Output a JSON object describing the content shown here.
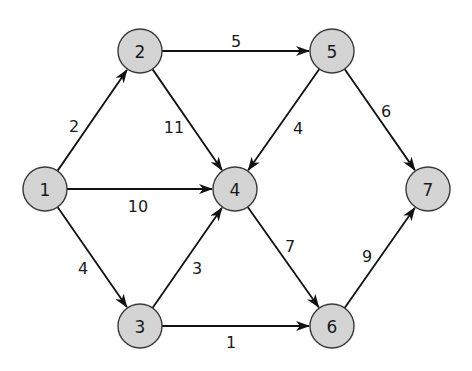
{
  "graph": {
    "type": "directed-weighted",
    "node_radius": 22,
    "colors": {
      "node_fill": "#d4d4d4",
      "node_stroke": "#3a3a3a",
      "edge": "#111111",
      "text": "#1a1a1a"
    },
    "nodes": [
      {
        "id": "1",
        "label": "1",
        "x": 45,
        "y": 189
      },
      {
        "id": "2",
        "label": "2",
        "x": 140,
        "y": 51
      },
      {
        "id": "3",
        "label": "3",
        "x": 140,
        "y": 326
      },
      {
        "id": "4",
        "label": "4",
        "x": 235,
        "y": 189
      },
      {
        "id": "5",
        "label": "5",
        "x": 332,
        "y": 51
      },
      {
        "id": "6",
        "label": "6",
        "x": 332,
        "y": 326
      },
      {
        "id": "7",
        "label": "7",
        "x": 428,
        "y": 189
      }
    ],
    "edges": [
      {
        "from": "1",
        "to": "2",
        "weight": "2",
        "lx": 74,
        "ly": 126
      },
      {
        "from": "1",
        "to": "4",
        "weight": "10",
        "lx": 138,
        "ly": 206
      },
      {
        "from": "1",
        "to": "3",
        "weight": "4",
        "lx": 83,
        "ly": 268
      },
      {
        "from": "2",
        "to": "5",
        "weight": "5",
        "lx": 236,
        "ly": 41
      },
      {
        "from": "2",
        "to": "4",
        "weight": "11",
        "lx": 174,
        "ly": 127
      },
      {
        "from": "3",
        "to": "4",
        "weight": "3",
        "lx": 197,
        "ly": 268
      },
      {
        "from": "3",
        "to": "6",
        "weight": "1",
        "lx": 231,
        "ly": 342
      },
      {
        "from": "5",
        "to": "4",
        "weight": "4",
        "lx": 298,
        "ly": 128
      },
      {
        "from": "5",
        "to": "7",
        "weight": "6",
        "lx": 386,
        "ly": 111
      },
      {
        "from": "4",
        "to": "6",
        "weight": "7",
        "lx": 290,
        "ly": 246
      },
      {
        "from": "6",
        "to": "7",
        "weight": "9",
        "lx": 367,
        "ly": 256
      }
    ]
  }
}
